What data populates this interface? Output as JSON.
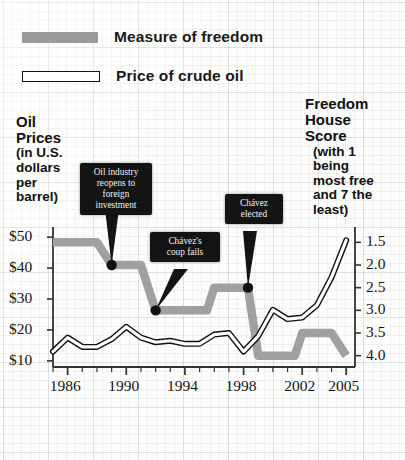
{
  "legend": {
    "items": [
      {
        "label": "Measure of freedom",
        "swatch": "gray-bar-swatch",
        "color": "#9b9b9b"
      },
      {
        "label": "Price of crude oil",
        "swatch": "outline-bar-swatch",
        "color": "#ffffff"
      }
    ]
  },
  "left_axis_title": {
    "line1": "Oil",
    "line2": "Prices",
    "line3": "(in U.S.",
    "line4": "dollars",
    "line5": "per",
    "line6": "barrel)"
  },
  "right_axis_title": {
    "line1": "Freedom",
    "line2": "House",
    "line3": "Score",
    "line4": "(with 1",
    "line5": "being",
    "line6": "most free",
    "line7": "and 7 the",
    "line8": "least)"
  },
  "chart_data": {
    "type": "line",
    "title": "",
    "xlabel": "",
    "ylabel": "Oil Prices (in U.S. dollars per barrel)",
    "y2label": "Freedom House Score (with 1 being most free and 7 the least)",
    "grid": true,
    "legend_position": "top-left",
    "xlim": [
      1985,
      2005.6
    ],
    "ylim": [
      8,
      52
    ],
    "y2lim": [
      1.25,
      4.25
    ],
    "y2_inverted": true,
    "xticks": [
      1986,
      1990,
      1994,
      1998,
      2002,
      2005
    ],
    "xticklabels": [
      "1986",
      "1990",
      "1994",
      "1998",
      "2002",
      "2005"
    ],
    "yticks": [
      10,
      20,
      30,
      40,
      50
    ],
    "yticklabels": [
      "$10",
      "$20",
      "$30",
      "$40",
      "$50"
    ],
    "y2ticks": [
      1.5,
      2.0,
      2.5,
      3.0,
      3.5,
      4.0
    ],
    "y2ticklabels": [
      "1.5",
      "2.0",
      "2.5",
      "3.0",
      "3.5",
      "4.0"
    ],
    "series": [
      {
        "name": "Price of crude oil",
        "axis": "left",
        "style": "outlined-white-line",
        "x": [
          1985,
          1986,
          1987,
          1988,
          1989,
          1990,
          1991,
          1992,
          1993,
          1994,
          1995,
          1996,
          1997,
          1998,
          1999,
          2000,
          2001,
          2002,
          2003,
          2004,
          2005
        ],
        "values": [
          13.0,
          17.5,
          14.5,
          14.5,
          17.0,
          21.0,
          17.5,
          16.0,
          16.5,
          15.5,
          15.5,
          18.5,
          19.0,
          13.0,
          18.0,
          26.5,
          23.5,
          24.0,
          28.0,
          37.0,
          49.0
        ]
      },
      {
        "name": "Measure of freedom",
        "axis": "right",
        "style": "thick-gray-step",
        "x": [
          1985,
          1988,
          1989,
          1991,
          1992,
          1995.5,
          1996,
          1998.3,
          1999,
          2001.5,
          2002,
          2004,
          2005
        ],
        "values": [
          1.5,
          1.5,
          2.0,
          2.0,
          3.0,
          3.0,
          2.5,
          2.5,
          4.0,
          4.0,
          3.5,
          3.5,
          4.0
        ]
      }
    ],
    "annotations": [
      {
        "text": "Oil industry reopens to foreign investment",
        "lines": [
          "Oil industry",
          "reopens to",
          "foreign",
          "investment"
        ],
        "point_year": 1989,
        "point_score": 2.0
      },
      {
        "text": "Chávez's coup fails",
        "lines": [
          "Chávez's",
          "coup fails"
        ],
        "point_year": 1992,
        "point_score": 3.0
      },
      {
        "text": "Chávez elected",
        "lines": [
          "Chávez",
          "elected"
        ],
        "point_year": 1998.3,
        "point_score": 2.5
      }
    ]
  }
}
